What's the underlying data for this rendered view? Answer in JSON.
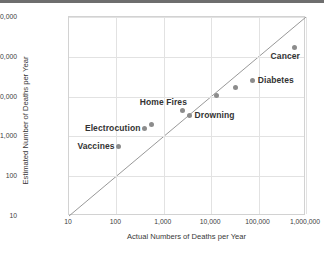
{
  "chart_data": {
    "type": "scatter",
    "title": "",
    "xlabel": "Actual Numbers of Deaths per Year",
    "ylabel": "Estimated Number of Deaths per Year",
    "xscale": "log",
    "yscale": "log",
    "xlim": [
      10,
      1000000
    ],
    "ylim": [
      10,
      1000000
    ],
    "grid": true,
    "legend": "none",
    "xticks": [
      "10",
      "100",
      "1,000",
      "10,000",
      "100,000",
      "1,000,000"
    ],
    "xtick_values": [
      10,
      100,
      1000,
      10000,
      100000,
      1000000
    ],
    "yticks": [
      "10",
      "100",
      "1,000",
      "10,000",
      "100,000",
      "1,000,000"
    ],
    "ytick_values": [
      10,
      100,
      1000,
      10000,
      100000,
      1000000
    ],
    "reference_line": {
      "name": "identity-line",
      "from": [
        10,
        10
      ],
      "to": [
        1000000,
        1000000
      ],
      "color": "#8c8c8c"
    },
    "marker_color": "#8c8c8c",
    "points": [
      {
        "name": "vaccines",
        "label": "Vaccines",
        "x": 110,
        "y": 560,
        "label_pos": "left"
      },
      {
        "name": "electrocution",
        "label": "Electrocution",
        "x": 400,
        "y": 1600,
        "label_pos": "left"
      },
      {
        "name": "point-unlabeled-a",
        "label": "",
        "x": 560,
        "y": 2050,
        "label_pos": "none"
      },
      {
        "name": "home-fires",
        "label": "Home Fires",
        "x": 2500,
        "y": 4500,
        "label_pos": "above-left"
      },
      {
        "name": "drowning",
        "label": "Drowning",
        "x": 3500,
        "y": 3400,
        "label_pos": "right"
      },
      {
        "name": "point-unlabeled-b",
        "label": "",
        "x": 13000,
        "y": 11000,
        "label_pos": "none"
      },
      {
        "name": "point-unlabeled-c",
        "label": "",
        "x": 32000,
        "y": 17000,
        "label_pos": "none"
      },
      {
        "name": "diabetes",
        "label": "Diabetes",
        "x": 75000,
        "y": 26000,
        "label_pos": "right"
      },
      {
        "name": "cancer",
        "label": "Cancer",
        "x": 575000,
        "y": 170000,
        "label_pos": "below-left"
      }
    ]
  }
}
